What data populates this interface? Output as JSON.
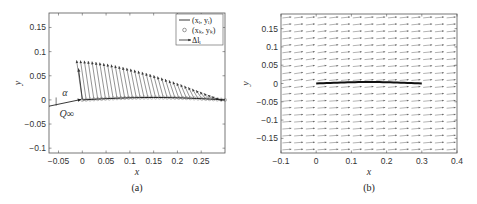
{
  "chart_data": [
    {
      "type": "line",
      "panel": "(a)",
      "caption": "(a)",
      "xlabel": "x",
      "ylabel": "y",
      "xlim": [
        -0.07,
        0.3
      ],
      "ylim": [
        -0.11,
        0.18
      ],
      "xticks": [
        "-0.05",
        "0",
        "0.05",
        "0.1",
        "0.15",
        "0.2",
        "0.25"
      ],
      "xtick_values": [
        -0.05,
        0,
        0.05,
        0.1,
        0.15,
        0.2,
        0.25
      ],
      "yticks": [
        "0.15",
        "0.1",
        "0.05",
        "0",
        "-0.05",
        "-0.1"
      ],
      "ytick_values": [
        0.15,
        0.1,
        0.05,
        0,
        -0.05,
        -0.1
      ],
      "grid": false,
      "legend": {
        "position": "upper right",
        "entries": [
          "(x_i, y_i)",
          "(x_k, y_k)",
          "Δl_i"
        ]
      },
      "series": [
        {
          "name": "(x_i, y_i)",
          "style": "line",
          "x": [
            0,
            0.05,
            0.1,
            0.15,
            0.2,
            0.25,
            0.3
          ],
          "y": [
            0,
            0.004,
            0.005,
            0.005,
            0.004,
            0.002,
            0
          ]
        },
        {
          "name": "(x_k, y_k)",
          "style": "circles",
          "x": [
            0,
            0.05,
            0.1,
            0.15,
            0.2,
            0.25,
            0.3
          ],
          "y": [
            0,
            0.004,
            0.005,
            0.005,
            0.004,
            0.002,
            0
          ]
        },
        {
          "name": "Δl_i",
          "style": "arrows",
          "note": "arrow tips envelope",
          "x": [
            -0.01,
            0.0,
            0.05,
            0.1,
            0.15,
            0.2,
            0.25,
            0.3
          ],
          "y": [
            0.07,
            0.08,
            0.08,
            0.075,
            0.06,
            0.045,
            0.025,
            0
          ]
        }
      ],
      "annotations": [
        "α",
        "Q_∞"
      ]
    },
    {
      "type": "quiver",
      "panel": "(b)",
      "caption": "(b)",
      "xlabel": "x",
      "ylabel": "y",
      "xlim": [
        -0.1,
        0.4
      ],
      "ylim": [
        -0.19,
        0.19
      ],
      "xticks": [
        "-0.1",
        "0",
        "0.1",
        "0.2",
        "0.3",
        "0.4"
      ],
      "xtick_values": [
        -0.1,
        0,
        0.1,
        0.2,
        0.3,
        0.4
      ],
      "yticks": [
        "0.15",
        "0.1",
        "0.05",
        "0",
        "-0.05",
        "-0.1",
        "-0.15"
      ],
      "ytick_values": [
        0.15,
        0.1,
        0.05,
        0,
        -0.05,
        -0.1,
        -0.15
      ],
      "grid": false,
      "series": [
        {
          "name": "airfoil",
          "style": "thick line",
          "x": [
            0,
            0.05,
            0.1,
            0.15,
            0.2,
            0.25,
            0.3
          ],
          "y": [
            0,
            0.003,
            0.004,
            0.004,
            0.003,
            0.002,
            0
          ]
        },
        {
          "name": "velocity field",
          "style": "arrows",
          "note": "uniform flow at angle of attack, deflected near leading edge"
        }
      ]
    }
  ],
  "figure": {
    "captions": [
      "(a)",
      "(b)"
    ]
  }
}
